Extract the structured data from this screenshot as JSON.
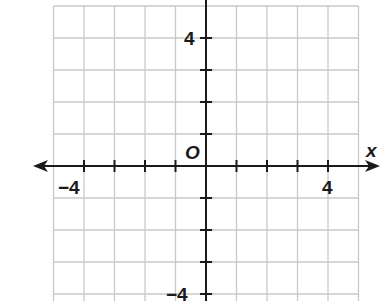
{
  "diagram": {
    "type": "coordinate-plane",
    "origin_label": "O",
    "x_axis_label": "x",
    "y_axis_label": "y",
    "x_tick_labels": [
      {
        "value": -4,
        "text": "−4"
      },
      {
        "value": 4,
        "text": "4"
      }
    ],
    "y_tick_labels": [
      {
        "value": 4,
        "text": "4"
      },
      {
        "value": -4,
        "text": "−4"
      }
    ],
    "x_range": [
      -5,
      5
    ],
    "y_range": [
      -5,
      5
    ],
    "grid": true,
    "grid_color": "#c8c8c8",
    "axis_color": "#1a1a1a"
  }
}
